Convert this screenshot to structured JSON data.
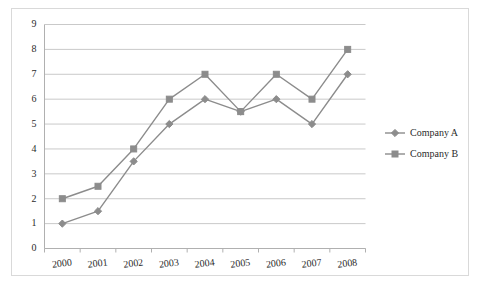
{
  "chart_data": {
    "type": "line",
    "title": "",
    "subtitle": "",
    "xlabel": "",
    "ylabel": "",
    "categories": [
      "2000",
      "2001",
      "2002",
      "2003",
      "2004",
      "2005",
      "2006",
      "2007",
      "2008"
    ],
    "series": [
      {
        "name": "Company A",
        "marker": "diamond",
        "color": "#8c8c8c",
        "values": [
          1,
          1.5,
          3.5,
          5,
          6,
          5.5,
          6,
          5,
          7
        ]
      },
      {
        "name": "Company B",
        "marker": "square",
        "color": "#8c8c8c",
        "values": [
          2,
          2.5,
          4,
          6,
          7,
          5.5,
          7,
          6,
          8
        ]
      }
    ],
    "ylim": [
      0,
      9
    ],
    "yticks": [
      "0",
      "1",
      "2",
      "3",
      "4",
      "5",
      "6",
      "7",
      "8",
      "9"
    ],
    "grid": "horizontal",
    "legend_position": "right",
    "colors": {
      "series_line": "#8c8c8c",
      "gridline": "#c9c9c9",
      "axis": "#b0b0b0",
      "text": "#2b2b2b",
      "frame": "#d9d9d9",
      "background": "#ffffff"
    }
  }
}
